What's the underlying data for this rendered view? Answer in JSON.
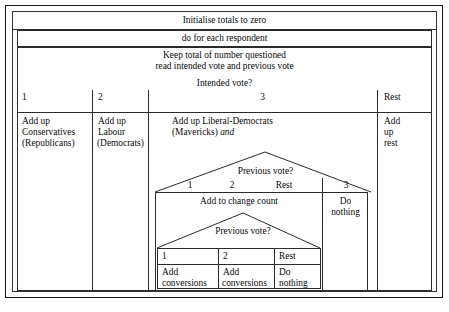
{
  "diagram": {
    "kind": "nassi-shneiderman-structogram",
    "title_row": {
      "text": "Initialise totals to zero"
    },
    "loop_row": {
      "text": "do for each respondent"
    },
    "body_block": {
      "line1": "Keep total of number questioned",
      "line2": "read intended vote and previous vote"
    },
    "decision_outer": {
      "question": "Intended vote?",
      "branch_labels": [
        "1",
        "2",
        "3",
        "Rest"
      ],
      "branches": [
        {
          "label": "1",
          "lines": [
            "Add up",
            "Conservatives",
            "(Republicans)"
          ]
        },
        {
          "label": "2",
          "lines": [
            "Add up",
            "Labour",
            "(Democrats)"
          ]
        },
        {
          "label": "3",
          "lines": [
            "Add up Liberal-Democrats",
            "(Mavericks) "
          ],
          "emphasis": "and"
        },
        {
          "label": "Rest",
          "lines": [
            "Add",
            "up",
            "rest"
          ]
        }
      ]
    },
    "decision_middle": {
      "question": "Previous vote?",
      "branch_labels": [
        "1",
        "2",
        "Rest",
        "3"
      ],
      "left_cell": {
        "text": "Add to change count"
      },
      "right_cell": {
        "lines": [
          "Do",
          "nothing"
        ]
      }
    },
    "decision_inner": {
      "question": "Previous vote?",
      "branch_labels": [
        "1",
        "2",
        "Rest"
      ],
      "cells": [
        {
          "label": "1",
          "lines": [
            "Add",
            "conversions"
          ]
        },
        {
          "label": "2",
          "lines": [
            "Add",
            "conversions"
          ]
        },
        {
          "label": "Rest",
          "lines": [
            "Do",
            "nothing"
          ]
        }
      ]
    },
    "colors": {
      "ink": "#0a0a0a",
      "rule": "#2b2b2b",
      "frame": "#111111",
      "background": "#ffffff"
    }
  }
}
